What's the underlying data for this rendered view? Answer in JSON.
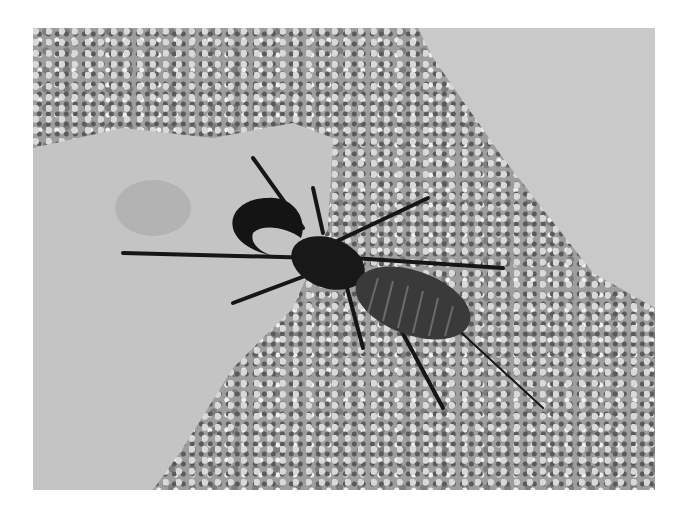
{
  "image": {
    "description": "Black-and-white photograph of a whip scorpion (vinegaroon) on gravel beside flat limestone rocks",
    "subject": "whip-scorpion",
    "background": [
      "gravel",
      "limestone-rock-left",
      "limestone-slab-top-right"
    ],
    "colors": {
      "frame": "#ffffff",
      "rock": "#c8c8c8",
      "gravel": "#9e9e9e",
      "animal": "#1a1a1a"
    }
  }
}
